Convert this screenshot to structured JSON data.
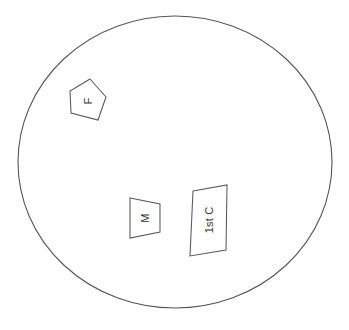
{
  "figure": {
    "background_color": "#ffffff",
    "line_color": "#555555",
    "text_color": "#333333",
    "caption": "",
    "canvas": {
      "width": 349,
      "height": 330
    }
  },
  "boundary": {
    "name": "circular-boundary",
    "type": "ellipse",
    "cx": 175,
    "cy": 162,
    "rx": 157,
    "ry": 146,
    "stroke": "#555555",
    "fill": "none"
  },
  "regions": [
    {
      "id": "region-f",
      "label": "F",
      "shape": "quadrilateral",
      "rotation_deg": -90,
      "points": "90,79 106,97 98,120 71,113 70,91",
      "label_x": 88,
      "label_y": 101
    },
    {
      "id": "region-m",
      "label": "M",
      "shape": "trapezoid",
      "rotation_deg": -90,
      "points": "130,198 160,204 160,232 130,238",
      "label_x": 145,
      "label_y": 218
    },
    {
      "id": "region-1st-c",
      "label": "1st C",
      "shape": "quadrilateral",
      "rotation_deg": -90,
      "points": "193,191 227,185 226,250 190,256",
      "label_x": 209,
      "label_y": 220
    }
  ]
}
